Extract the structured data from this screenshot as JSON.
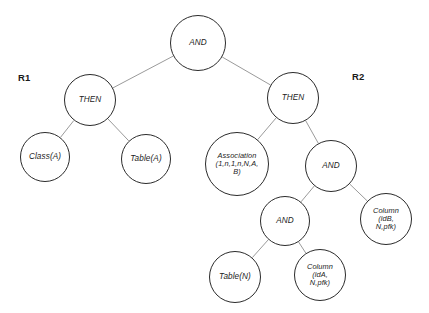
{
  "figure": {
    "type": "tree-diagram",
    "background_color": "#ffffff",
    "node_stroke_color": "#2b2b2b",
    "edge_stroke_color": "#8f8f8f",
    "text_color": "#1c1c1c"
  },
  "group_labels": [
    {
      "name": "R1",
      "text": "R1",
      "x": 18,
      "y": 72
    },
    {
      "name": "R2",
      "text": "R2",
      "x": 352,
      "y": 71
    }
  ],
  "nodes": [
    {
      "id": "root-and",
      "label": "AND",
      "cx": 198,
      "cy": 43,
      "r": 28,
      "size": "op"
    },
    {
      "id": "then-left",
      "label": "THEN",
      "cx": 90,
      "cy": 100,
      "r": 26,
      "size": "op"
    },
    {
      "id": "class-a",
      "label": "Class(A)",
      "cx": 45,
      "cy": 157,
      "r": 25,
      "size": "leaf"
    },
    {
      "id": "table-a",
      "label": "Table(A)",
      "cx": 146,
      "cy": 159,
      "r": 25,
      "size": "leaf"
    },
    {
      "id": "then-right",
      "label": "THEN",
      "cx": 293,
      "cy": 98,
      "r": 26,
      "size": "op"
    },
    {
      "id": "association",
      "label": "Association\n(1,n,1,n,N,A,\nB)",
      "cx": 237,
      "cy": 164,
      "r": 32,
      "size": "assoc"
    },
    {
      "id": "and-right-upper",
      "label": "AND",
      "cx": 331,
      "cy": 166,
      "r": 26,
      "size": "op"
    },
    {
      "id": "and-right-lower",
      "label": "AND",
      "cx": 285,
      "cy": 221,
      "r": 25,
      "size": "op"
    },
    {
      "id": "table-n",
      "label": "Table(N)",
      "cx": 235,
      "cy": 277,
      "r": 26,
      "size": "leaf"
    },
    {
      "id": "column-ida",
      "label": "Column\n(idA,\nN,pfk)",
      "cx": 320,
      "cy": 275,
      "r": 26,
      "size": "multi"
    },
    {
      "id": "column-idb",
      "label": "Column\n(idB,\nN,pfk)",
      "cx": 386,
      "cy": 219,
      "r": 26,
      "size": "multi"
    }
  ],
  "edges": [
    {
      "name": "edge-root-to-then-left",
      "from": "root-and",
      "to": "then-left"
    },
    {
      "name": "edge-root-to-then-right",
      "from": "root-and",
      "to": "then-right"
    },
    {
      "name": "edge-then-left-to-class-a",
      "from": "then-left",
      "to": "class-a"
    },
    {
      "name": "edge-then-left-to-table-a",
      "from": "then-left",
      "to": "table-a"
    },
    {
      "name": "edge-then-right-to-association",
      "from": "then-right",
      "to": "association"
    },
    {
      "name": "edge-then-right-to-and-upper",
      "from": "then-right",
      "to": "and-right-upper"
    },
    {
      "name": "edge-and-upper-to-and-lower",
      "from": "and-right-upper",
      "to": "and-right-lower"
    },
    {
      "name": "edge-and-upper-to-column-idb",
      "from": "and-right-upper",
      "to": "column-idb"
    },
    {
      "name": "edge-and-lower-to-table-n",
      "from": "and-right-lower",
      "to": "table-n"
    },
    {
      "name": "edge-and-lower-to-column-ida",
      "from": "and-right-lower",
      "to": "column-ida"
    }
  ],
  "caption": {
    "text": ""
  }
}
